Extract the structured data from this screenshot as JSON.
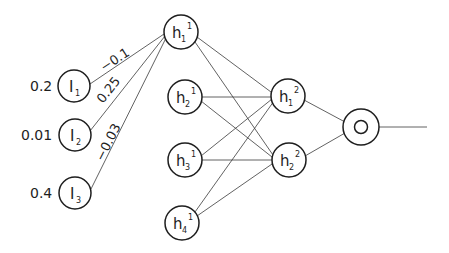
{
  "diagram": {
    "type": "feedforward-neural-network",
    "inputs": [
      {
        "id": "I1",
        "label": "I",
        "sub": "1",
        "value": "0.2",
        "cx": 74,
        "cy": 86
      },
      {
        "id": "I2",
        "label": "I",
        "sub": "2",
        "value": "0.01",
        "cx": 75,
        "cy": 135
      },
      {
        "id": "I3",
        "label": "I",
        "sub": "3",
        "value": "0.4",
        "cx": 75,
        "cy": 193
      }
    ],
    "hidden_layer_1": [
      {
        "id": "h1_1",
        "label": "h",
        "sub": "1",
        "sup": "1",
        "cx": 181,
        "cy": 32
      },
      {
        "id": "h2_1",
        "label": "h",
        "sub": "2",
        "sup": "1",
        "cx": 185,
        "cy": 97
      },
      {
        "id": "h3_1",
        "label": "h",
        "sub": "3",
        "sup": "1",
        "cx": 185,
        "cy": 160
      },
      {
        "id": "h4_1",
        "label": "h",
        "sub": "4",
        "sup": "1",
        "cx": 182,
        "cy": 223
      }
    ],
    "hidden_layer_2": [
      {
        "id": "h1_2",
        "label": "h",
        "sub": "1",
        "sup": "2",
        "cx": 288,
        "cy": 96
      },
      {
        "id": "h2_2",
        "label": "h",
        "sub": "2",
        "sup": "2",
        "cx": 289,
        "cy": 160
      }
    ],
    "output": {
      "id": "O",
      "label": "O",
      "cx": 361,
      "cy": 127
    },
    "weights": [
      {
        "from": "I1",
        "to": "h1_1",
        "label": "−0.1"
      },
      {
        "from": "I2",
        "to": "h1_1",
        "label": "0.25"
      },
      {
        "from": "I3",
        "to": "h1_1",
        "label": "−0.03"
      }
    ]
  }
}
